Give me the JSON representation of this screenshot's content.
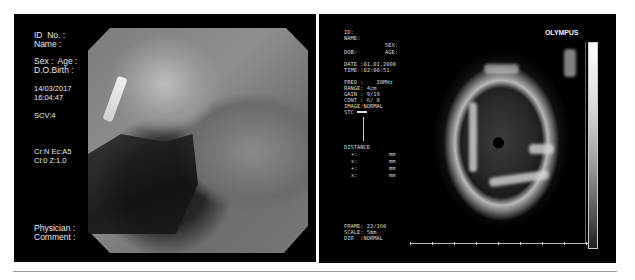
{
  "left_panel": {
    "id_label": "ID  No. :",
    "name_label": "Name :",
    "sex_age_label": "Sex :  Age :",
    "dob_label": "D.O.Birth :",
    "date": "14/03/2017",
    "time": "16:04:47",
    "scv": "SCV:4",
    "settings_line1": "Cr:N Ec:A5",
    "settings_line2": "Cl:0 Z:1.0",
    "physician_label": "Physician :",
    "comment_label": "Comment :"
  },
  "right_panel": {
    "brand": "OLYMPUS",
    "id_label": "ID:",
    "name_label": "NAME:",
    "sex_label": "SEX:",
    "dob_label": "DOB:",
    "age_label": "AGE:",
    "date_line": "DATE :01.01.2000",
    "time_line": "TIME :02:00:51",
    "freq_line": "FREQ :    20MHz",
    "range_line": "RANGE: 4cm",
    "gain_line": "GAIN : 9/19",
    "cont_line": "CONT : 6/ 8",
    "image_line": "IMAGE:NORMAL",
    "stc_label": "STC",
    "distance_label": "DISTANCE",
    "distance_rows": [
      {
        "marker": "+:",
        "unit": "mm"
      },
      {
        "marker": "x:",
        "unit": "mm"
      },
      {
        "marker": "+:",
        "unit": "mm"
      },
      {
        "marker": "x:",
        "unit": "mm"
      }
    ],
    "frame_line": "FRAME: 22/160",
    "scale_line": "SCALE: 5mm",
    "dir_line": "DIR  :NORMAL"
  }
}
